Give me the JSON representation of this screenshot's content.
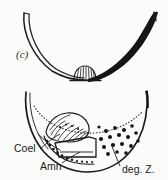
{
  "figure": {
    "panel_tag": "(c)",
    "background_color": "#fbfbfa",
    "ink_color": "#141414",
    "width": 168,
    "height": 180
  },
  "annotations": {
    "coelom": {
      "label": "Coel",
      "x": 14,
      "y": 152
    },
    "amnion": {
      "label": "Amn",
      "x": 40,
      "y": 170
    },
    "degenerating_zone": {
      "label": "deg. Z.",
      "x": 122,
      "y": 172
    }
  },
  "upper_diagram": {
    "name": "upper-cross-section",
    "description": "U-shaped cross-section with thin paired curves on the left and a thick solid black tapering band on the right, meeting at a small striated fan-shaped structure at the base center"
  },
  "lower_diagram": {
    "name": "lower-cross-section",
    "description": "U-shaped cross-section containing a striated teardrop structure, an angular quadrilateral chamber, a dotted interior arc, a beaded amnion line and a field of scattered dark granules on the right"
  }
}
